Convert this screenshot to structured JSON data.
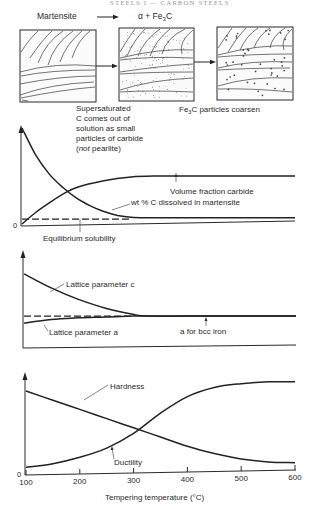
{
  "header": {
    "running_title": "STEELS I — CARBON STEELS"
  },
  "micro": {
    "stage1_label": "Martensite",
    "stage2_label_alpha": "α + Fe",
    "stage2_label_sub": "3",
    "stage2_label_c": "C",
    "caption2_lines": [
      "Supersaturated",
      "C comes out of",
      "solution as small",
      "particles of carbide"
    ],
    "caption2_last_open": "(",
    "caption2_last_italic": "not",
    "caption2_last_rest": " pearlite)",
    "caption3_pre": "Fe",
    "caption3_sub": "3",
    "caption3_post": "C particles coarsen"
  },
  "chart_data": [
    {
      "type": "line",
      "title": "",
      "xlabel": "Tempering temperature (°C)",
      "ylabel": "",
      "xlim": [
        100,
        600
      ],
      "ylim": [
        0,
        1
      ],
      "y_origin_label": "0",
      "grid": false,
      "series": [
        {
          "name": "wt % C dissolved in martensite",
          "style": "solid",
          "x": [
            100,
            125,
            150,
            175,
            200,
            225,
            250,
            275,
            300,
            325,
            400,
            500,
            600
          ],
          "y": [
            1.0,
            0.72,
            0.52,
            0.38,
            0.27,
            0.19,
            0.13,
            0.09,
            0.07,
            0.065,
            0.065,
            0.065,
            0.065
          ]
        },
        {
          "name": "Volume fraction carbide",
          "style": "solid",
          "x": [
            100,
            125,
            150,
            175,
            200,
            250,
            300,
            350,
            400,
            500,
            600
          ],
          "y": [
            0.0,
            0.12,
            0.22,
            0.31,
            0.38,
            0.45,
            0.49,
            0.5,
            0.5,
            0.5,
            0.5
          ]
        },
        {
          "name": "Equilibrium solubility",
          "style": "dashed",
          "x": [
            100,
            300
          ],
          "y": [
            0.05,
            0.05
          ]
        }
      ],
      "annotations": [
        "Volume fraction carbide",
        "wt % C dissolved in martensite",
        "Equilibrium solubility"
      ]
    },
    {
      "type": "line",
      "title": "",
      "xlabel": "Tempering temperature (°C)",
      "ylabel": "",
      "xlim": [
        100,
        600
      ],
      "ylim": [
        0,
        1
      ],
      "grid": false,
      "series": [
        {
          "name": "Lattice parameter c",
          "style": "solid",
          "x": [
            100,
            150,
            200,
            250,
            300,
            325,
            400,
            500,
            600
          ],
          "y": [
            0.82,
            0.66,
            0.53,
            0.43,
            0.36,
            0.34,
            0.34,
            0.34,
            0.34
          ]
        },
        {
          "name": "Lattice parameter a",
          "style": "solid",
          "x": [
            100,
            150,
            200,
            250,
            300,
            325,
            600
          ],
          "y": [
            0.26,
            0.3,
            0.32,
            0.33,
            0.34,
            0.34,
            0.34
          ]
        },
        {
          "name": "a for bcc iron",
          "style": "dashed",
          "x": [
            100,
            300
          ],
          "y": [
            0.34,
            0.34
          ]
        }
      ],
      "annotations": [
        "Lattice parameter c",
        "Lattice parameter a",
        "a for bcc iron"
      ]
    },
    {
      "type": "line",
      "title": "",
      "xlabel": "Tempering temperature (°C)",
      "ylabel": "",
      "xlim": [
        100,
        600
      ],
      "ylim": [
        0,
        1
      ],
      "y_origin_label": "0",
      "x_ticks": [
        100,
        200,
        300,
        400,
        500,
        600
      ],
      "x_tick_labels": [
        "100",
        "200",
        "300",
        "400",
        "500",
        "600"
      ],
      "grid": false,
      "series": [
        {
          "name": "Hardness",
          "style": "solid",
          "x": [
            100,
            150,
            200,
            250,
            300,
            350,
            400,
            450,
            500,
            550,
            600
          ],
          "y": [
            0.88,
            0.78,
            0.68,
            0.58,
            0.48,
            0.38,
            0.28,
            0.2,
            0.14,
            0.11,
            0.1
          ]
        },
        {
          "name": "Ductility",
          "style": "solid",
          "x": [
            100,
            150,
            200,
            250,
            300,
            350,
            400,
            450,
            500,
            550,
            600
          ],
          "y": [
            0.05,
            0.09,
            0.16,
            0.26,
            0.42,
            0.64,
            0.82,
            0.92,
            0.96,
            0.98,
            0.98
          ]
        }
      ],
      "annotations": [
        "Hardness",
        "Ductility"
      ]
    }
  ]
}
